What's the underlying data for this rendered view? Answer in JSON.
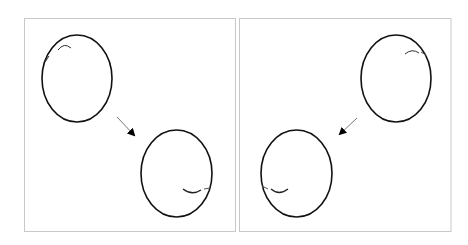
{
  "figure": {
    "colors": {
      "background": "#ffffff",
      "frame": "#c8c8c8",
      "stroke": "#111111",
      "arrow_shaft": "#777777",
      "arrow_head": "#000000"
    },
    "panels": [
      {
        "id": "left",
        "motion": "down-right",
        "start_marker": "top-left",
        "end_marker": "bottom-right"
      },
      {
        "id": "right",
        "motion": "down-left",
        "start_marker": "top-right",
        "end_marker": "bottom-left"
      }
    ]
  }
}
